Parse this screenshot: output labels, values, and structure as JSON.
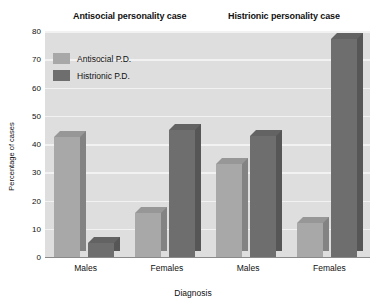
{
  "chart_data": {
    "type": "bar",
    "title": "",
    "xlabel": "Diagnosis",
    "ylabel": "Percentage of cases",
    "ylim": [
      0,
      80
    ],
    "yticks": [
      0,
      10,
      20,
      30,
      40,
      50,
      60,
      70,
      80
    ],
    "grid": true,
    "legend_position": "top-left-inside",
    "group_titles": [
      "Antisocial personality case",
      "Histrionic personality case"
    ],
    "categories": [
      "Males",
      "Females",
      "Males",
      "Females"
    ],
    "series": [
      {
        "name": "Antisocial P.D.",
        "color": "#a8a8a8",
        "values": [
          42.5,
          15.5,
          33.0,
          12.0
        ]
      },
      {
        "name": "Histrionic P.D.",
        "color": "#6e6e6e",
        "values": [
          5.0,
          45.0,
          43.0,
          77.0
        ]
      }
    ],
    "colors": {
      "plot_background": "#dedede",
      "gridline": "#f2f2f2",
      "axis": "#8a8a8a",
      "antisocial_bar": "#a8a8a8",
      "histrionic_bar": "#6e6e6e",
      "text": "#111111"
    }
  }
}
